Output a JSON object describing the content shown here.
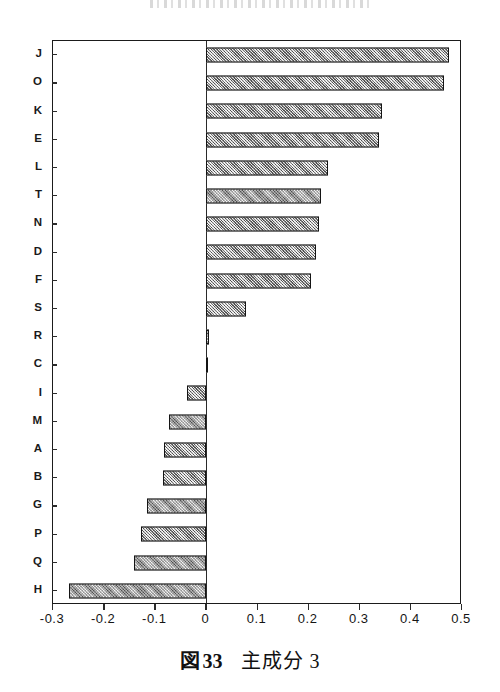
{
  "figure": {
    "header_smudge": "",
    "caption": {
      "label": "図",
      "number": "33",
      "title": "主成分 3"
    }
  },
  "chart_data": {
    "type": "bar",
    "orientation": "horizontal",
    "title": "",
    "subtitle": "",
    "xlabel": "",
    "ylabel": "",
    "xlim": [
      -0.3,
      0.5
    ],
    "ylim": null,
    "grid": false,
    "legend": null,
    "xticks": [
      "-0.3",
      "-0.2",
      "-0.1",
      "0",
      "0.1",
      "0.2",
      "0.3",
      "0.4",
      "0.5"
    ],
    "xtick_values": [
      -0.3,
      -0.2,
      -0.1,
      0,
      0.1,
      0.2,
      0.3,
      0.4,
      0.5
    ],
    "categories": [
      "J",
      "O",
      "K",
      "E",
      "L",
      "T",
      "N",
      "D",
      "F",
      "S",
      "R",
      "C",
      "I",
      "M",
      "A",
      "B",
      "G",
      "P",
      "Q",
      "H"
    ],
    "values": [
      0.474,
      0.465,
      0.344,
      0.338,
      0.238,
      0.225,
      0.221,
      0.215,
      0.205,
      0.078,
      0.006,
      0.001,
      -0.037,
      -0.074,
      -0.082,
      -0.084,
      -0.117,
      -0.127,
      -0.141,
      -0.269
    ],
    "bar_color": "#a9a9a9",
    "bar_edge_color": "#141414",
    "frame_color": "#1b1b1b",
    "zero_line_color": "#2a2a2a"
  }
}
